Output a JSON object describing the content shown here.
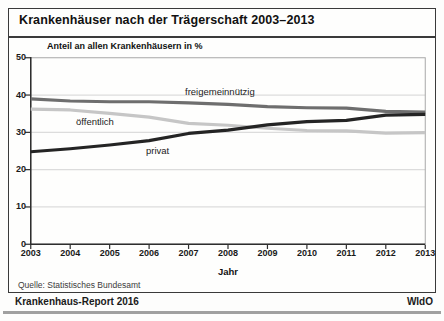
{
  "title": "Krankenhäuser nach der Trägerschaft 2003–2013",
  "chart_data": {
    "type": "line",
    "title": "Krankenhäuser nach der Trägerschaft 2003–2013",
    "ylabel": "Anteil an allen Krankenhäusern in %",
    "xlabel": "Jahr",
    "ylim": [
      0,
      50
    ],
    "yticks": [
      0,
      10,
      20,
      30,
      40,
      50
    ],
    "grid": true,
    "legend_position": "inline-labels-on-lines",
    "categories": [
      "2003",
      "2004",
      "2005",
      "2006",
      "2007",
      "2008",
      "2009",
      "2010",
      "2011",
      "2012",
      "2013"
    ],
    "series": [
      {
        "name": "öffentlich",
        "color": "#c6c6c6",
        "values": [
          36.2,
          36.0,
          35.1,
          34.1,
          32.4,
          31.9,
          31.1,
          30.5,
          30.4,
          29.8,
          29.9
        ]
      },
      {
        "name": "freigemeinnützig",
        "color": "#6e6e6e",
        "values": [
          39.0,
          38.4,
          38.2,
          38.2,
          37.9,
          37.5,
          36.9,
          36.6,
          36.5,
          35.6,
          35.4
        ]
      },
      {
        "name": "privat",
        "color": "#242424",
        "values": [
          24.8,
          25.6,
          26.6,
          27.8,
          29.7,
          30.6,
          32.0,
          32.9,
          33.2,
          34.6,
          34.8
        ]
      }
    ],
    "colors": {
      "grid": "#dcdcdc",
      "plot_border": "#a8a8a8",
      "axis": "#2e2e2e"
    }
  },
  "footer": {
    "source": "Quelle: Statistisches Bundesamt",
    "report": "Krankenhaus-Report 2016",
    "org": "WIdO"
  }
}
